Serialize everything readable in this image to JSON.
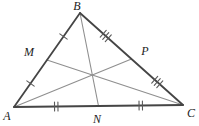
{
  "figure": {
    "type": "geometry-triangle-with-medians",
    "width": 199,
    "height": 126,
    "background": "#ffffff",
    "side_color": "#454545",
    "median_color": "#8f8f8f",
    "tick_color": "#5a5a5a",
    "label_color": "#1c1c1c",
    "points": {
      "A": {
        "x": 14,
        "y": 107,
        "label": "A",
        "lx": 7,
        "ly": 120
      },
      "B": {
        "x": 80,
        "y": 13,
        "label": "B",
        "lx": 77,
        "ly": 10
      },
      "C": {
        "x": 183,
        "y": 105,
        "label": "C",
        "lx": 191,
        "ly": 117
      },
      "M": {
        "x": 47,
        "y": 60,
        "label": "M",
        "lx": 29,
        "ly": 56
      },
      "P": {
        "x": 131.5,
        "y": 59,
        "label": "P",
        "lx": 145,
        "ly": 55
      },
      "N": {
        "x": 98.5,
        "y": 106,
        "label": "N",
        "lx": 97,
        "ly": 123
      }
    },
    "sides": [
      {
        "from": "A",
        "to": "B",
        "midpoint": "M",
        "ticks": 1
      },
      {
        "from": "B",
        "to": "C",
        "midpoint": "P",
        "ticks": 3
      },
      {
        "from": "A",
        "to": "C",
        "midpoint": "N",
        "ticks": 2
      }
    ],
    "medians": [
      {
        "from": "A",
        "to": "P"
      },
      {
        "from": "B",
        "to": "N"
      },
      {
        "from": "C",
        "to": "M"
      }
    ],
    "tick_length": 9,
    "tick_spacing": 3.4,
    "side_width": 1.8,
    "median_width": 1.1,
    "tick_width": 1.1
  }
}
